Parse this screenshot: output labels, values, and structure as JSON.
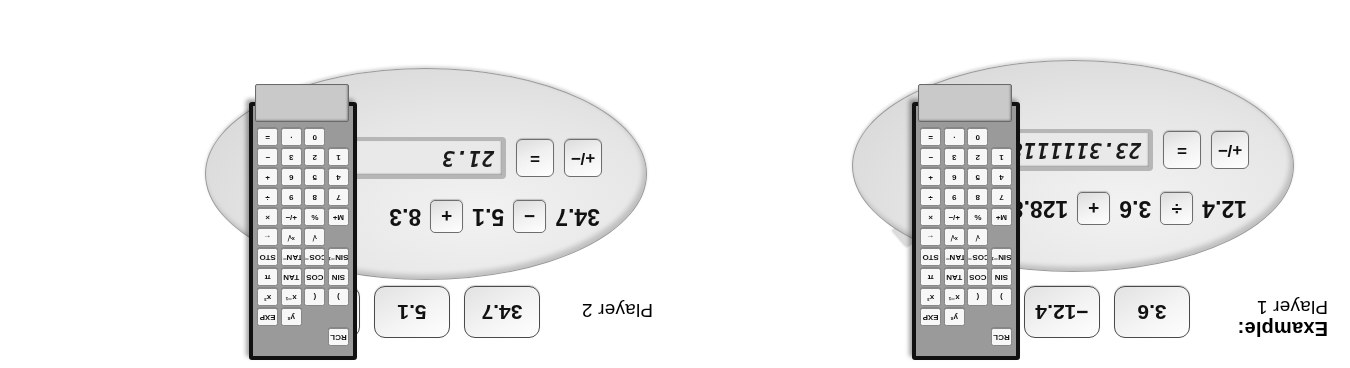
{
  "page": {
    "orientation": "rotated-180",
    "bg_color": "#ffffff"
  },
  "panels": [
    {
      "id": "player-1",
      "example_label": "Example:",
      "player_label": "Player 1",
      "cards": [
        "3.6",
        "−12.4",
        "128.8"
      ],
      "bubble": {
        "expression_parts": [
          "12.4",
          "÷",
          "3.6",
          "+",
          "128.8"
        ],
        "operand_1": "12.4",
        "operator_1": "÷",
        "operand_2": "3.6",
        "operator_2": "+",
        "operand_3": "128.8",
        "sign_key": "+/−",
        "equals_key": "=",
        "display_value": "23.3111118"
      }
    },
    {
      "id": "player-2",
      "example_label": "",
      "player_label": "Player 2",
      "cards": [
        "34.7",
        "5.1",
        "−8.3"
      ],
      "bubble": {
        "expression_parts": [
          "34.7",
          "−",
          "5.1",
          "+",
          "8.3"
        ],
        "operand_1": "34.7",
        "operator_1": "−",
        "operand_2": "5.1",
        "operator_2": "+",
        "operand_3": "8.3",
        "sign_key": "+/−",
        "equals_key": "=",
        "display_value": "21.3"
      }
    }
  ],
  "calculator": {
    "keys": [
      "RCL",
      "",
      "",
      "yˣ",
      "EXP",
      "",
      ")",
      "x⁻¹",
      "x²",
      "SIN",
      "TAN",
      "π",
      "SIN⁻¹",
      "TAN⁻¹",
      "STO",
      "√",
      "ˣ√",
      "←",
      "M+",
      "%",
      "×",
      "7",
      "8",
      "9",
      "4",
      "5",
      "6",
      "1",
      "2",
      "3",
      "%",
      "+/−",
      "×",
      "8",
      "9",
      "÷",
      "5",
      "6",
      "+",
      "2",
      "3",
      "−",
      "0",
      "·",
      "="
    ],
    "rows": [
      [
        "RCL",
        "",
        ""
      ],
      [
        ")",
        "yˣ",
        "EXP"
      ],
      [
        "SIN",
        "x⁻¹",
        "x²"
      ],
      [
        "COS",
        "TAN",
        "π"
      ],
      [
        "COS⁻¹",
        "TAN⁻¹",
        "STO"
      ],
      [
        "√",
        "ˣ√y",
        "←"
      ],
      [
        "M+",
        "%",
        "×"
      ],
      [
        "7",
        "8",
        "÷"
      ],
      [
        "4",
        "5",
        "+"
      ],
      [
        "1",
        "2",
        "3"
      ],
      [
        "0",
        "·",
        "="
      ]
    ],
    "layout_rows": [
      [
        "RCL",
        "",
        ""
      ],
      [
        "",
        "yˣ",
        "EXP"
      ],
      [
        ")",
        "x⁻¹",
        "x²"
      ],
      [
        "SIN",
        "TAN",
        "π"
      ],
      [
        "SIN⁻¹",
        "TAN⁻¹",
        "STO"
      ],
      [
        "√",
        "ˣ√",
        "←"
      ],
      [
        "M+",
        "%",
        "×"
      ],
      [
        "7",
        "8",
        "÷"
      ],
      [
        "4",
        "5",
        "+"
      ],
      [
        "1",
        "2",
        "3"
      ],
      [
        "0",
        "·",
        "="
      ]
    ],
    "full_rows": [
      [
        "RCL",
        "blank",
        "blank"
      ],
      [
        "blank",
        "yˣ",
        "EXP"
      ],
      [
        "(",
        "x⁻¹",
        "x²"
      ],
      [
        "COS",
        "TAN",
        "π"
      ],
      [
        "COS⁻¹",
        "TAN⁻¹",
        "STO"
      ],
      [
        "√",
        "ˣ√",
        "←"
      ],
      [
        "%",
        "+/−",
        "×"
      ],
      [
        "8",
        "9",
        "÷"
      ],
      [
        "5",
        "6",
        "+"
      ],
      [
        "2",
        "3",
        "−"
      ],
      [
        "0",
        "·",
        "="
      ]
    ],
    "columns_left": [
      "RCL",
      ")",
      "SIN",
      "SIN⁻¹",
      "√",
      "M+"
    ],
    "grid": [
      [
        "RCL",
        "",
        ""
      ],
      [
        ")",
        "yˣ",
        "EXP"
      ],
      [
        "SIN",
        "x⁻¹",
        "x²"
      ],
      [
        "SIN⁻¹",
        "TAN",
        "π"
      ],
      [
        "√",
        "TAN⁻¹",
        "STO"
      ],
      [
        "M+",
        "ˣ√",
        "←"
      ],
      [
        "7",
        "%",
        "×"
      ],
      [
        "4",
        "8",
        "÷"
      ],
      [
        "1",
        "5",
        "+"
      ],
      [
        "0",
        "2",
        "−"
      ],
      [
        "",
        "·",
        "="
      ]
    ],
    "matrix": [
      [
        "RCL",
        "",
        "",
        "",
        ""
      ],
      [
        "",
        "yˣ",
        "EXP",
        "",
        ""
      ]
    ],
    "display_value": ""
  },
  "calculator_keys_grid": [
    [
      "",
      "",
      "RCL",
      "",
      ""
    ],
    [
      "",
      "yˣ",
      "EXP",
      "",
      ""
    ],
    [
      "(",
      "x⁻¹",
      "x²",
      ")",
      ""
    ],
    [
      "COS",
      "TAN",
      "π",
      "SIN",
      ""
    ],
    [
      "COS⁻¹",
      "TAN⁻¹",
      "STO",
      "SIN⁻¹",
      ""
    ],
    [
      "√",
      "ˣ√",
      "←",
      "",
      ""
    ],
    [
      "%",
      "+/−",
      "×",
      "M+",
      ""
    ],
    [
      "8",
      "9",
      "÷",
      "7",
      ""
    ],
    [
      "5",
      "6",
      "+",
      "4",
      ""
    ],
    [
      "2",
      "3",
      "−",
      "1",
      ""
    ],
    [
      "0",
      "·",
      "=",
      "",
      ""
    ]
  ],
  "calculator_rows": [
    {
      "keys": [
        "RCL",
        "",
        ""
      ]
    },
    {
      "keys": [
        "",
        "yˣ",
        "EXP"
      ]
    },
    {
      "keys": [
        ")",
        "x⁻¹",
        "x²"
      ]
    },
    {
      "keys": [
        "SIN",
        "TAN",
        "π"
      ]
    },
    {
      "keys": [
        "SIN⁻¹",
        "TAN⁻¹",
        "STO"
      ]
    },
    {
      "keys": [
        "√",
        "ˣ√",
        "←"
      ]
    },
    {
      "keys": [
        "M+",
        "%",
        "×"
      ]
    },
    {
      "keys": [
        "7",
        "8",
        "÷"
      ]
    },
    {
      "keys": [
        "4",
        "5",
        "+"
      ]
    },
    {
      "keys": [
        "1",
        "2",
        "3"
      ]
    },
    {
      "keys": [
        "0",
        "·",
        "="
      ]
    }
  ],
  "calculator_final": [
    [
      "RCL",
      "",
      ""
    ],
    [
      "",
      "yˣ",
      "EXP"
    ],
    [
      "(",
      ")",
      ""
    ],
    [
      "COS",
      "SIN",
      ""
    ],
    [
      "",
      "",
      ""
    ],
    [
      "",
      "",
      ""
    ],
    [
      "",
      "",
      ""
    ],
    [
      "",
      "",
      ""
    ],
    [
      "",
      "",
      ""
    ],
    [
      "",
      "",
      ""
    ],
    [
      "",
      "",
      ""
    ]
  ],
  "keypad_render": [
    [
      "RCL",
      "",
      ""
    ],
    [
      "yˣ",
      "EXP",
      ""
    ],
    [
      "(",
      "x⁻¹",
      "x²"
    ],
    [
      "COS",
      "TAN",
      "π"
    ],
    [
      "COS⁻¹",
      "TAN⁻¹",
      "STO"
    ],
    [
      "√",
      "ˣ√",
      "←"
    ],
    [
      "%",
      "+/−",
      "×"
    ],
    [
      "8",
      "9",
      "÷"
    ],
    [
      "5",
      "6",
      "+"
    ],
    [
      "2",
      "3",
      "−"
    ],
    [
      "0",
      "·",
      "="
    ]
  ],
  "keypad_render_left": [
    [
      ")",
      "SIN",
      "SIN⁻¹",
      "M+",
      "7",
      "4",
      "1"
    ],
    [
      "RCL"
    ]
  ],
  "keypad_full": [
    [
      "",
      "",
      "RCL"
    ],
    [
      "",
      "yˣ",
      "EXP"
    ],
    [
      "(",
      "x⁻¹",
      "x²"
    ],
    [
      "COS",
      "TAN",
      "π"
    ],
    [
      "COS⁻¹",
      "TAN⁻¹",
      "STO"
    ],
    [
      "√",
      "ˣ√",
      "←"
    ],
    [
      "%",
      "+/−",
      "×"
    ],
    [
      "8",
      "9",
      "÷"
    ],
    [
      "5",
      "6",
      "+"
    ],
    [
      "2",
      "3",
      "−"
    ],
    [
      "0",
      "·",
      "="
    ],
    [
      ")",
      "SIN",
      "SIN⁻¹"
    ],
    [
      "M+",
      "7",
      "4"
    ],
    [
      "1",
      "",
      ""
    ]
  ],
  "keypad": {
    "columns": 3,
    "rows": [
      {
        "cells": [
          "RCL",
          "",
          ""
        ]
      },
      {
        "cells": [
          "",
          "yˣ",
          "EXP"
        ]
      },
      {
        "cells": [
          ")",
          "x⁻¹",
          "x²"
        ]
      },
      {
        "cells": [
          "SIN",
          "TAN",
          "π"
        ]
      },
      {
        "cells": [
          "SIN⁻¹",
          "TAN⁻¹",
          "STO"
        ]
      },
      {
        "cells": [
          "√",
          "ˣ√",
          "←"
        ]
      },
      {
        "cells": [
          "M+",
          "%",
          "×"
        ]
      },
      {
        "cells": [
          "7",
          "8",
          "÷"
        ]
      },
      {
        "cells": [
          "4",
          "5",
          "+"
        ]
      },
      {
        "cells": [
          "1",
          "2",
          "3"
        ]
      },
      {
        "cells": [
          "0",
          "·",
          "="
        ]
      }
    ]
  },
  "keypad_4col": {
    "rows": [
      {
        "cells": [
          "RCL",
          "",
          "",
          ""
        ]
      },
      {
        "cells": [
          "",
          "",
          "yˣ",
          "EXP"
        ]
      },
      {
        "cells": [
          ")",
          "(",
          "x⁻¹",
          "x²"
        ]
      },
      {
        "cells": [
          "SIN",
          "COS",
          "TAN",
          "π"
        ]
      },
      {
        "cells": [
          "SIN⁻¹",
          "COS⁻¹",
          "TAN⁻¹",
          "STO"
        ]
      },
      {
        "cells": [
          "",
          "√",
          "ˣ√",
          "←"
        ]
      },
      {
        "cells": [
          "M+",
          "%",
          "+/−",
          "×"
        ]
      },
      {
        "cells": [
          "7",
          "8",
          "9",
          "÷"
        ]
      },
      {
        "cells": [
          "4",
          "5",
          "6",
          "+"
        ]
      },
      {
        "cells": [
          "1",
          "2",
          "3",
          "−"
        ]
      },
      {
        "cells": [
          "",
          "0",
          "·",
          "="
        ]
      }
    ]
  }
}
